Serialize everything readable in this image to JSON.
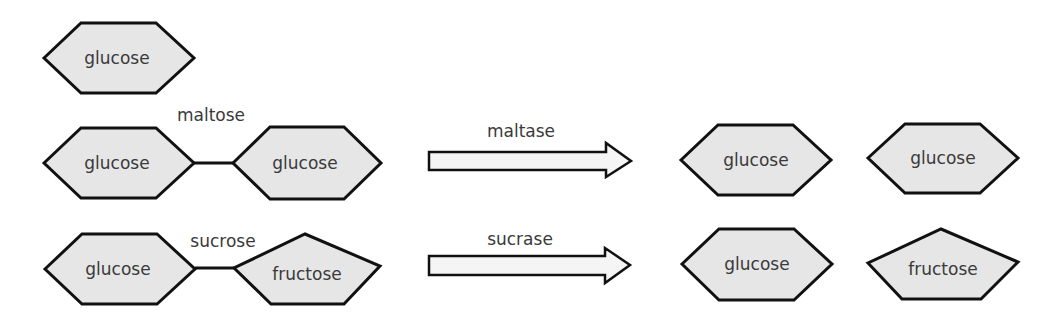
{
  "diagram": {
    "top": {
      "monomer_label": "glucose"
    },
    "maltose_row": {
      "disaccharide_label": "maltose",
      "left_unit": "glucose",
      "right_unit": "glucose",
      "enzyme_label": "maltase",
      "product_1": "glucose",
      "product_2": "glucose"
    },
    "sucrose_row": {
      "disaccharide_label": "sucrose",
      "left_unit": "glucose",
      "right_unit": "fructose",
      "enzyme_label": "sucrase",
      "product_1": "glucose",
      "product_2": "fructose"
    },
    "colors": {
      "shape_fill": "#e6e6e6",
      "arrow_fill": "#f5f5f5",
      "outline": "#111111",
      "text": "#3a3a3a"
    }
  }
}
